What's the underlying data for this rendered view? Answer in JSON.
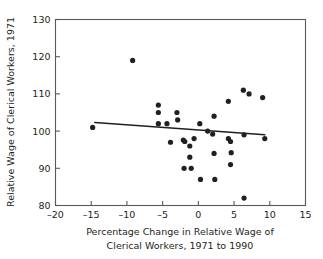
{
  "chart_data": {
    "type": "scatter",
    "title": "",
    "xlabel": "Percentage Change in Relative Wage of Clerical Workers, 1971 to 1990",
    "xlabel_line1": "Percentage Change in Relative Wage of",
    "xlabel_line2": "Clerical Workers, 1971 to 1990",
    "ylabel": "Relative Wage of Clerical Workers, 1971",
    "xlim": [
      -20,
      15
    ],
    "ylim": [
      80,
      130
    ],
    "xticks": [
      -20,
      -15,
      -10,
      -5,
      0,
      5,
      10,
      15
    ],
    "xtick_labels": [
      "–20",
      "–15",
      "–10",
      "–5",
      "0",
      "5",
      "10",
      "15"
    ],
    "yticks": [
      80,
      90,
      100,
      110,
      120,
      130
    ],
    "ytick_labels": [
      "80",
      "90",
      "100",
      "110",
      "120",
      "130"
    ],
    "grid": false,
    "legend": false,
    "marker_color": "#231f20",
    "marker_radius": 2.6,
    "axis_color": "#58595b",
    "points": [
      {
        "x": -14.8,
        "y": 101
      },
      {
        "x": -9.2,
        "y": 119
      },
      {
        "x": -5.6,
        "y": 107
      },
      {
        "x": -5.6,
        "y": 105
      },
      {
        "x": -5.6,
        "y": 102
      },
      {
        "x": -4.4,
        "y": 102
      },
      {
        "x": -3.9,
        "y": 97
      },
      {
        "x": -3.0,
        "y": 105
      },
      {
        "x": -2.9,
        "y": 103
      },
      {
        "x": -2.1,
        "y": 97.6
      },
      {
        "x": -1.9,
        "y": 97.2
      },
      {
        "x": -2.0,
        "y": 90
      },
      {
        "x": -1.2,
        "y": 96
      },
      {
        "x": -1.2,
        "y": 93
      },
      {
        "x": -1.0,
        "y": 90
      },
      {
        "x": -0.6,
        "y": 98
      },
      {
        "x": 0.2,
        "y": 102
      },
      {
        "x": 0.3,
        "y": 87
      },
      {
        "x": 1.3,
        "y": 100
      },
      {
        "x": 2.2,
        "y": 104
      },
      {
        "x": 2.0,
        "y": 99.2
      },
      {
        "x": 2.2,
        "y": 94
      },
      {
        "x": 2.3,
        "y": 87
      },
      {
        "x": 4.2,
        "y": 108
      },
      {
        "x": 4.2,
        "y": 98
      },
      {
        "x": 4.5,
        "y": 97.2
      },
      {
        "x": 4.6,
        "y": 94.2
      },
      {
        "x": 4.5,
        "y": 91
      },
      {
        "x": 6.3,
        "y": 111
      },
      {
        "x": 6.4,
        "y": 99
      },
      {
        "x": 6.4,
        "y": 82
      },
      {
        "x": 7.1,
        "y": 110
      },
      {
        "x": 9.0,
        "y": 109
      },
      {
        "x": 9.3,
        "y": 98
      }
    ],
    "trendline": {
      "x_start": -14.5,
      "y_start": 102.3,
      "x_end": 9.3,
      "y_end": 99.0,
      "color": "#231f20",
      "description": "fitted regression line, slight negative slope"
    }
  }
}
